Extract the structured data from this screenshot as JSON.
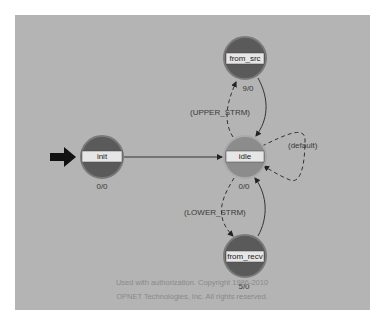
{
  "diagram": {
    "type": "state-machine",
    "states": [
      {
        "id": "init",
        "label": "init",
        "exec": "0/0",
        "initial": true,
        "forced": true
      },
      {
        "id": "idle",
        "label": "idle",
        "exec": "0/0",
        "initial": false,
        "forced": false
      },
      {
        "id": "from_src",
        "label": "from_src",
        "exec": "9/0",
        "initial": false,
        "forced": true
      },
      {
        "id": "from_recv",
        "label": "from_recv",
        "exec": "5/0",
        "initial": false,
        "forced": true
      }
    ],
    "transitions": [
      {
        "from": "init",
        "to": "idle",
        "label": "",
        "style": "solid"
      },
      {
        "from": "idle",
        "to": "from_src",
        "label": "(UPPER_STRM)",
        "style": "dashed"
      },
      {
        "from": "from_src",
        "to": "idle",
        "label": "",
        "style": "solid"
      },
      {
        "from": "idle",
        "to": "from_recv",
        "label": "(LOWER_STRM)",
        "style": "dashed"
      },
      {
        "from": "from_recv",
        "to": "idle",
        "label": "",
        "style": "solid"
      },
      {
        "from": "idle",
        "to": "idle",
        "label": "(default)",
        "style": "dashed"
      }
    ]
  },
  "labels": {
    "init": "init",
    "init_exec": "0/0",
    "idle": "idle",
    "idle_exec": "0/0",
    "from_src": "from_src",
    "from_src_exec": "9/0",
    "from_recv": "from_recv",
    "from_recv_exec": "5/0",
    "upper": "(UPPER_STRM)",
    "lower": "(LOWER_STRM)",
    "default": "(default)"
  },
  "colors": {
    "background": "#b4b4b4",
    "forced_state": "#5a5a5a",
    "unforced_state": "#8c8c8c",
    "label_box": "#e6e6e6"
  },
  "copyright": {
    "line1": "Used with authorization. Copyright 1986-2010",
    "line2": "OPNET Technologies, Inc.  All rights reserved."
  }
}
